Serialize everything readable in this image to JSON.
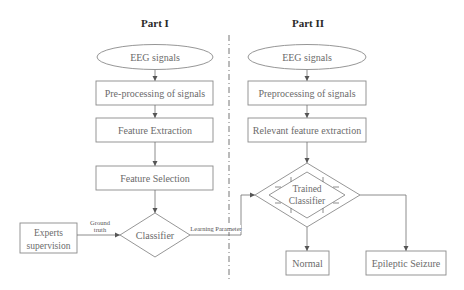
{
  "part1": {
    "title": "Part I",
    "input": "EEG signals",
    "step1": "Pre-processing of signals",
    "step2": "Feature Extraction",
    "step3": "Feature Selection",
    "classifier": "Classifier",
    "supervisor": [
      "Experts",
      "supervision"
    ],
    "edge_ground_truth": [
      "Ground",
      "truth"
    ],
    "edge_learning": "Learning Parameter"
  },
  "part2": {
    "title": "Part II",
    "input": "EEG signals",
    "step1": "Preprocessing of signals",
    "step2": "Relevant feature extraction",
    "classifier": [
      "Trained",
      "Classifier"
    ],
    "out_normal": "Normal",
    "out_seizure": "Epileptic Seizure"
  },
  "colors": {
    "stroke": "#8a8a8a",
    "text": "#6b6b6b",
    "title": "#2a2a2a"
  }
}
